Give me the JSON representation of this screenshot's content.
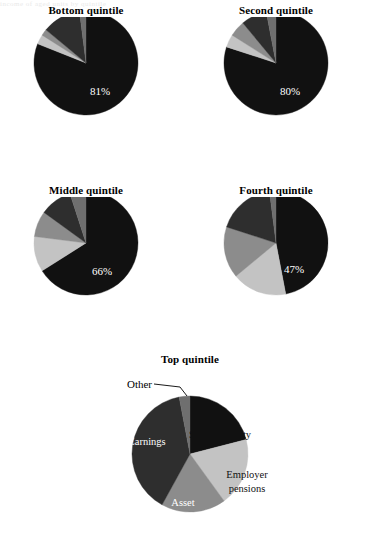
{
  "figure": {
    "cropped_header_fragment": "income of aged units by quintile",
    "colors": {
      "social_security": "#111111",
      "employer_pensions": "#c3c3c3",
      "asset_income": "#8c8c8c",
      "earnings": "#2e2e2e",
      "other": "#6f6f6f",
      "background": "#ffffff",
      "label_light": "#ffffff",
      "label_dark": "#111111"
    },
    "legend_categories": [
      "Social security",
      "Employer pensions",
      "Asset income",
      "Earnings",
      "Other"
    ]
  },
  "charts": [
    {
      "id": "bottom-quintile",
      "title": "Bottom quintile",
      "center_label": "81%",
      "slice_labels": []
    },
    {
      "id": "second-quintile",
      "title": "Second quintile",
      "center_label": "80%",
      "slice_labels": []
    },
    {
      "id": "middle-quintile",
      "title": "Middle quintile",
      "center_label": "66%",
      "slice_labels": []
    },
    {
      "id": "fourth-quintile",
      "title": "Fourth quintile",
      "center_label": "47%",
      "slice_labels": []
    },
    {
      "id": "top-quintile",
      "title": "Top quintile",
      "center_label": "21%",
      "slice_labels": [
        "Social security",
        "Employer pensions",
        "Asset income",
        "Earnings",
        "Other"
      ],
      "callout_label": "Other"
    }
  ],
  "chart_data": {
    "type": "pie",
    "xlabel": "",
    "ylabel": "",
    "legend_position": "none",
    "grid": false,
    "categories": [
      "Social security",
      "Employer pensions",
      "Asset income",
      "Earnings",
      "Other"
    ],
    "colors": [
      "#111111",
      "#c3c3c3",
      "#8c8c8c",
      "#2e2e2e",
      "#6f6f6f"
    ],
    "panels": [
      {
        "name": "Bottom quintile",
        "values": [
          81,
          3,
          2,
          12,
          2
        ],
        "labels_shown": [
          "81%"
        ]
      },
      {
        "name": "Second quintile",
        "values": [
          80,
          4,
          5,
          8,
          3
        ],
        "labels_shown": [
          "80%"
        ]
      },
      {
        "name": "Middle quintile",
        "values": [
          66,
          11,
          8,
          10,
          5
        ],
        "labels_shown": [
          "66%"
        ]
      },
      {
        "name": "Fourth quintile",
        "values": [
          47,
          17,
          16,
          18,
          2
        ],
        "labels_shown": [
          "47%"
        ]
      },
      {
        "name": "Top quintile",
        "values": [
          21,
          19,
          18,
          39,
          3
        ],
        "labels_shown": [
          "21%",
          "Social security",
          "Employer pensions",
          "Asset income",
          "Earnings",
          "Other"
        ]
      }
    ]
  },
  "geometry": {
    "panels": [
      {
        "cx": 86,
        "cy": 98,
        "r": 52,
        "title_y": 6
      },
      {
        "cx": 276,
        "cy": 98,
        "r": 52,
        "title_y": 6
      },
      {
        "cx": 86,
        "cy": 272,
        "r": 52,
        "title_y": 186
      },
      {
        "cx": 276,
        "cy": 272,
        "r": 52,
        "title_y": 186
      },
      {
        "cx": 190,
        "cy": 457,
        "r": 58,
        "title_y": 355
      }
    ]
  }
}
